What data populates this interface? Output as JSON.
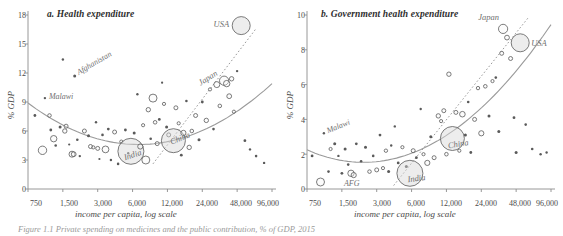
{
  "figure": {
    "caption": "Figure 1.1 Private spending on medicines and the public contribution, % of GDP, 2015"
  },
  "chart_data": [
    {
      "id": "panel-a",
      "type": "scatter",
      "title": "a. Health expenditure",
      "xlabel": "income per capita, log scale",
      "ylabel": "% GDP",
      "xscale": "log",
      "xlim": [
        750,
        96000
      ],
      "ylim": [
        0,
        18
      ],
      "yticks": [
        0,
        3,
        6,
        9,
        12,
        15,
        18
      ],
      "xticks": [
        750,
        1500,
        3000,
        6000,
        12000,
        24000,
        48000,
        96000
      ],
      "xtick_labels": [
        "750",
        "1,500",
        "3,000",
        "6,000",
        "12,000",
        "24,000",
        "48,000",
        "96,000"
      ],
      "grid": false,
      "legend": "none",
      "marker": "bubble, area proportional to population",
      "fit_curve": "U-shaped quadratic fit in log income",
      "trend_line": "dotted upper envelope toward USA",
      "annotations": [
        {
          "label": "USA",
          "x": 52000,
          "y": 16.9,
          "bubble": 1.0
        },
        {
          "label": "Japan",
          "x": 37000,
          "y": 11.2,
          "bubble": 0.55
        },
        {
          "label": "China",
          "x": 13500,
          "y": 5.0,
          "bubble": 0.9
        },
        {
          "label": "India",
          "x": 5800,
          "y": 3.9,
          "bubble": 0.88
        },
        {
          "label": "Afghanistan",
          "x": 1900,
          "y": 11.7,
          "bubble": 0.12
        },
        {
          "label": "Malawi",
          "x": 1050,
          "y": 9.4,
          "bubble": 0.1
        }
      ],
      "points": [
        {
          "x": 860,
          "y": 7.6,
          "r": 1.4
        },
        {
          "x": 1000,
          "y": 4.0,
          "r": 4.2
        },
        {
          "x": 1050,
          "y": 9.4,
          "r": 1.2
        },
        {
          "x": 1150,
          "y": 7.6,
          "r": 1.8
        },
        {
          "x": 1180,
          "y": 6.1,
          "r": 1.4
        },
        {
          "x": 1250,
          "y": 5.2,
          "r": 3.2
        },
        {
          "x": 1300,
          "y": 4.5,
          "r": 1.3
        },
        {
          "x": 1420,
          "y": 6.4,
          "r": 1.5
        },
        {
          "x": 1500,
          "y": 13.4,
          "r": 1.2
        },
        {
          "x": 1560,
          "y": 6.0,
          "r": 2.2
        },
        {
          "x": 1600,
          "y": 6.5,
          "r": 2.0
        },
        {
          "x": 1700,
          "y": 4.6,
          "r": 1.1
        },
        {
          "x": 1800,
          "y": 3.6,
          "r": 3.0
        },
        {
          "x": 1860,
          "y": 3.6,
          "r": 2.4
        },
        {
          "x": 1900,
          "y": 11.7,
          "r": 1.5
        },
        {
          "x": 2000,
          "y": 5.1,
          "r": 1.3
        },
        {
          "x": 2100,
          "y": 3.4,
          "r": 1.2
        },
        {
          "x": 2300,
          "y": 6.0,
          "r": 2.0
        },
        {
          "x": 2500,
          "y": 5.5,
          "r": 1.5
        },
        {
          "x": 2600,
          "y": 4.4,
          "r": 2.0
        },
        {
          "x": 2750,
          "y": 4.3,
          "r": 1.6
        },
        {
          "x": 2900,
          "y": 6.9,
          "r": 1.2
        },
        {
          "x": 3000,
          "y": 4.2,
          "r": 2.0
        },
        {
          "x": 3100,
          "y": 3.1,
          "r": 1.1
        },
        {
          "x": 3300,
          "y": 5.6,
          "r": 1.3
        },
        {
          "x": 3500,
          "y": 4.1,
          "r": 3.4
        },
        {
          "x": 3700,
          "y": 6.2,
          "r": 1.4
        },
        {
          "x": 3900,
          "y": 3.0,
          "r": 1.2
        },
        {
          "x": 4200,
          "y": 5.9,
          "r": 2.0
        },
        {
          "x": 4500,
          "y": 2.6,
          "r": 1.3
        },
        {
          "x": 4800,
          "y": 4.9,
          "r": 1.6
        },
        {
          "x": 5200,
          "y": 6.1,
          "r": 1.4
        },
        {
          "x": 5500,
          "y": 3.7,
          "r": 1.2
        },
        {
          "x": 5800,
          "y": 3.9,
          "r": 13.0
        },
        {
          "x": 6200,
          "y": 5.8,
          "r": 1.5
        },
        {
          "x": 6600,
          "y": 9.8,
          "r": 1.2
        },
        {
          "x": 7000,
          "y": 4.4,
          "r": 2.6
        },
        {
          "x": 7400,
          "y": 6.6,
          "r": 1.6
        },
        {
          "x": 7800,
          "y": 3.0,
          "r": 4.0
        },
        {
          "x": 8200,
          "y": 8.2,
          "r": 2.2
        },
        {
          "x": 8600,
          "y": 5.2,
          "r": 1.3
        },
        {
          "x": 9000,
          "y": 9.4,
          "r": 4.0
        },
        {
          "x": 9400,
          "y": 6.9,
          "r": 1.8
        },
        {
          "x": 9800,
          "y": 4.7,
          "r": 2.0
        },
        {
          "x": 10200,
          "y": 7.2,
          "r": 1.4
        },
        {
          "x": 10800,
          "y": 11.0,
          "r": 1.1
        },
        {
          "x": 11200,
          "y": 8.8,
          "r": 1.6
        },
        {
          "x": 11800,
          "y": 6.4,
          "r": 1.5
        },
        {
          "x": 12300,
          "y": 5.6,
          "r": 2.0
        },
        {
          "x": 13500,
          "y": 5.0,
          "r": 12.0
        },
        {
          "x": 14200,
          "y": 8.4,
          "r": 2.0
        },
        {
          "x": 15000,
          "y": 6.8,
          "r": 1.6
        },
        {
          "x": 15800,
          "y": 3.5,
          "r": 1.4
        },
        {
          "x": 16500,
          "y": 5.8,
          "r": 2.6
        },
        {
          "x": 17500,
          "y": 9.1,
          "r": 1.3
        },
        {
          "x": 18500,
          "y": 4.3,
          "r": 2.2
        },
        {
          "x": 19500,
          "y": 6.0,
          "r": 1.8
        },
        {
          "x": 21000,
          "y": 7.6,
          "r": 2.0
        },
        {
          "x": 22500,
          "y": 5.1,
          "r": 1.5
        },
        {
          "x": 24000,
          "y": 9.0,
          "r": 1.4
        },
        {
          "x": 26000,
          "y": 7.1,
          "r": 2.2
        },
        {
          "x": 28000,
          "y": 10.3,
          "r": 1.6
        },
        {
          "x": 30000,
          "y": 6.2,
          "r": 1.3
        },
        {
          "x": 32000,
          "y": 10.8,
          "r": 3.0
        },
        {
          "x": 34000,
          "y": 8.6,
          "r": 1.8
        },
        {
          "x": 37000,
          "y": 11.2,
          "r": 4.6
        },
        {
          "x": 39000,
          "y": 10.9,
          "r": 3.2
        },
        {
          "x": 41000,
          "y": 9.6,
          "r": 2.4
        },
        {
          "x": 43000,
          "y": 11.4,
          "r": 2.2
        },
        {
          "x": 45000,
          "y": 8.0,
          "r": 1.6
        },
        {
          "x": 48000,
          "y": 12.2,
          "r": 1.2
        },
        {
          "x": 52000,
          "y": 16.9,
          "r": 9.0
        },
        {
          "x": 56000,
          "y": 5.0,
          "r": 1.4
        },
        {
          "x": 62000,
          "y": 4.1,
          "r": 1.2
        },
        {
          "x": 70000,
          "y": 3.4,
          "r": 1.3
        },
        {
          "x": 82000,
          "y": 2.7,
          "r": 1.2
        }
      ]
    },
    {
      "id": "panel-b",
      "type": "scatter",
      "title": "b. Government health expenditure",
      "xlabel": "income per capita, log scale",
      "ylabel": "% GDP",
      "xscale": "log",
      "xlim": [
        750,
        96000
      ],
      "ylim": [
        0,
        10
      ],
      "yticks": [
        0,
        2,
        4,
        6,
        8,
        10
      ],
      "xticks": [
        750,
        1500,
        3000,
        6000,
        12000,
        24000,
        48000,
        96000
      ],
      "xtick_labels": [
        "750",
        "1,500",
        "3,000",
        "6,000",
        "12,000",
        "24,000",
        "48,000",
        "96,000"
      ],
      "grid": false,
      "legend": "none",
      "marker": "bubble, area proportional to population",
      "fit_curve": "rising convex fit in log income",
      "trend_line": "dotted upper envelope toward Japan and USA",
      "annotations": [
        {
          "label": "Japan",
          "x": 37000,
          "y": 9.2,
          "bubble": 0.55
        },
        {
          "label": "USA",
          "x": 52000,
          "y": 8.4,
          "bubble": 1.0
        },
        {
          "label": "China",
          "x": 13500,
          "y": 2.9,
          "bubble": 0.9
        },
        {
          "label": "India",
          "x": 5800,
          "y": 0.9,
          "bubble": 0.88
        },
        {
          "label": "AFG",
          "x": 1900,
          "y": 0.8,
          "bubble": 0.14
        },
        {
          "label": "Malawi",
          "x": 1050,
          "y": 3.2,
          "bubble": 0.1
        }
      ],
      "points": [
        {
          "x": 830,
          "y": 1.9,
          "r": 1.4
        },
        {
          "x": 980,
          "y": 0.4,
          "r": 4.0
        },
        {
          "x": 1050,
          "y": 3.2,
          "r": 1.2
        },
        {
          "x": 1150,
          "y": 1.0,
          "r": 1.3
        },
        {
          "x": 1200,
          "y": 2.3,
          "r": 1.6
        },
        {
          "x": 1300,
          "y": 2.6,
          "r": 1.5
        },
        {
          "x": 1400,
          "y": 1.9,
          "r": 1.2
        },
        {
          "x": 1500,
          "y": 0.9,
          "r": 1.4
        },
        {
          "x": 1600,
          "y": 2.3,
          "r": 1.5
        },
        {
          "x": 1700,
          "y": 1.4,
          "r": 1.3
        },
        {
          "x": 1800,
          "y": 0.9,
          "r": 3.2
        },
        {
          "x": 1900,
          "y": 0.8,
          "r": 2.6
        },
        {
          "x": 2000,
          "y": 2.6,
          "r": 1.4
        },
        {
          "x": 2200,
          "y": 1.6,
          "r": 1.3
        },
        {
          "x": 2400,
          "y": 2.4,
          "r": 1.5
        },
        {
          "x": 2600,
          "y": 1.0,
          "r": 1.8
        },
        {
          "x": 2800,
          "y": 1.9,
          "r": 1.3
        },
        {
          "x": 3000,
          "y": 1.1,
          "r": 2.0
        },
        {
          "x": 3200,
          "y": 3.1,
          "r": 1.4
        },
        {
          "x": 3400,
          "y": 1.2,
          "r": 1.6
        },
        {
          "x": 3600,
          "y": 2.2,
          "r": 1.7
        },
        {
          "x": 3800,
          "y": 1.0,
          "r": 1.5
        },
        {
          "x": 4000,
          "y": 2.5,
          "r": 1.2
        },
        {
          "x": 4300,
          "y": 3.6,
          "r": 1.2
        },
        {
          "x": 4600,
          "y": 1.5,
          "r": 1.4
        },
        {
          "x": 5000,
          "y": 2.4,
          "r": 1.6
        },
        {
          "x": 5400,
          "y": 1.3,
          "r": 1.5
        },
        {
          "x": 5800,
          "y": 0.9,
          "r": 13.0
        },
        {
          "x": 6200,
          "y": 2.2,
          "r": 2.0
        },
        {
          "x": 6600,
          "y": 1.8,
          "r": 1.4
        },
        {
          "x": 7200,
          "y": 4.6,
          "r": 1.2
        },
        {
          "x": 7600,
          "y": 2.0,
          "r": 1.6
        },
        {
          "x": 8200,
          "y": 1.5,
          "r": 2.6
        },
        {
          "x": 8800,
          "y": 3.0,
          "r": 1.5
        },
        {
          "x": 9400,
          "y": 1.8,
          "r": 2.0
        },
        {
          "x": 10200,
          "y": 4.2,
          "r": 2.2
        },
        {
          "x": 10800,
          "y": 3.9,
          "r": 1.6
        },
        {
          "x": 11400,
          "y": 4.5,
          "r": 2.0
        },
        {
          "x": 12000,
          "y": 2.0,
          "r": 1.8
        },
        {
          "x": 12600,
          "y": 6.6,
          "r": 2.2
        },
        {
          "x": 13500,
          "y": 2.9,
          "r": 12.0
        },
        {
          "x": 14500,
          "y": 4.4,
          "r": 2.0
        },
        {
          "x": 15500,
          "y": 2.2,
          "r": 1.6
        },
        {
          "x": 16500,
          "y": 4.3,
          "r": 2.8
        },
        {
          "x": 17500,
          "y": 3.1,
          "r": 1.5
        },
        {
          "x": 18500,
          "y": 5.0,
          "r": 1.3
        },
        {
          "x": 19500,
          "y": 2.1,
          "r": 1.4
        },
        {
          "x": 21000,
          "y": 4.0,
          "r": 2.0
        },
        {
          "x": 22500,
          "y": 5.8,
          "r": 1.7
        },
        {
          "x": 24000,
          "y": 3.2,
          "r": 2.6
        },
        {
          "x": 26000,
          "y": 5.9,
          "r": 1.8
        },
        {
          "x": 28000,
          "y": 4.2,
          "r": 1.5
        },
        {
          "x": 30000,
          "y": 6.2,
          "r": 1.6
        },
        {
          "x": 32000,
          "y": 6.4,
          "r": 1.3
        },
        {
          "x": 34000,
          "y": 3.3,
          "r": 1.5
        },
        {
          "x": 36000,
          "y": 7.8,
          "r": 2.0
        },
        {
          "x": 37000,
          "y": 9.2,
          "r": 4.6
        },
        {
          "x": 40000,
          "y": 8.7,
          "r": 2.4
        },
        {
          "x": 43000,
          "y": 7.5,
          "r": 2.0
        },
        {
          "x": 46000,
          "y": 4.1,
          "r": 1.4
        },
        {
          "x": 48000,
          "y": 2.1,
          "r": 1.5
        },
        {
          "x": 52000,
          "y": 8.4,
          "r": 9.0
        },
        {
          "x": 58000,
          "y": 3.7,
          "r": 1.3
        },
        {
          "x": 66000,
          "y": 2.3,
          "r": 1.3
        },
        {
          "x": 78000,
          "y": 2.0,
          "r": 1.2
        },
        {
          "x": 88000,
          "y": 2.1,
          "r": 1.2
        }
      ]
    }
  ],
  "panel_a": {
    "title": "a. Health expenditure",
    "ylabel": "% GDP",
    "xlabel": "income per capita, log scale",
    "yticks": [
      "0",
      "3",
      "6",
      "9",
      "12",
      "15",
      "18"
    ],
    "xticks": [
      "750",
      "1,500",
      "3,000",
      "6,000",
      "12,000",
      "24,000",
      "48,000",
      "96,000"
    ],
    "labels": {
      "usa": "USA",
      "japan": "Japan",
      "china": "China",
      "india": "India",
      "afghanistan": "Afghanistan",
      "malawi": "Malawi"
    }
  },
  "panel_b": {
    "title": "b. Government health expenditure",
    "ylabel": "% GDP",
    "xlabel": "income per capita, log scale",
    "yticks": [
      "0",
      "2",
      "4",
      "6",
      "8",
      "10"
    ],
    "xticks": [
      "750",
      "1,500",
      "3,000",
      "6,000",
      "12,000",
      "24,000",
      "48,000",
      "96,000"
    ],
    "labels": {
      "usa": "USA",
      "japan": "Japan",
      "china": "China",
      "india": "India",
      "afg": "AFG",
      "malawi": "Malawi"
    }
  },
  "colors": {
    "axis": "#8c8c8c",
    "bubble_stroke": "#5a5a5a",
    "bubble_fill": "#e8e8e8",
    "fit_curve": "#9a9a9a",
    "text": "#3a3a3a",
    "annot": "#6f6f6f"
  }
}
